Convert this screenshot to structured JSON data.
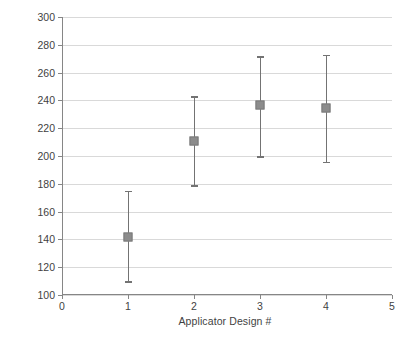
{
  "chart_data": {
    "type": "scatter",
    "title": "",
    "xlabel": "Applicator Design #",
    "ylabel": "Depth of Penetration (µm)",
    "xlim": [
      0,
      5
    ],
    "ylim": [
      100,
      300
    ],
    "x_ticks": [
      0,
      1,
      2,
      3,
      4,
      5
    ],
    "y_ticks": [
      100,
      120,
      140,
      160,
      180,
      200,
      220,
      240,
      260,
      280,
      300
    ],
    "grid": "horizontal",
    "legend": "none",
    "x": [
      1,
      2,
      3,
      4
    ],
    "values": [
      141.5,
      211.0,
      236.5,
      234.5
    ],
    "error_low": [
      110.0,
      179.0,
      200.0,
      196.0
    ],
    "error_high": [
      175.0,
      243.0,
      272.0,
      273.0
    ],
    "marker_color": "#8c8c8c",
    "errorbar_color": "#737373",
    "gridline_color": "#d9d9d9",
    "axis_color": "#868686",
    "background_color": "#ffffff",
    "points": [
      {
        "label": "1",
        "value": 141.5,
        "low": 110.0,
        "high": 175.0
      },
      {
        "label": "2",
        "value": 211.0,
        "low": 179.0,
        "high": 243.0
      },
      {
        "label": "3",
        "value": 236.5,
        "low": 200.0,
        "high": 272.0
      },
      {
        "label": "4",
        "value": 234.5,
        "low": 196.0,
        "high": 273.0
      }
    ]
  }
}
